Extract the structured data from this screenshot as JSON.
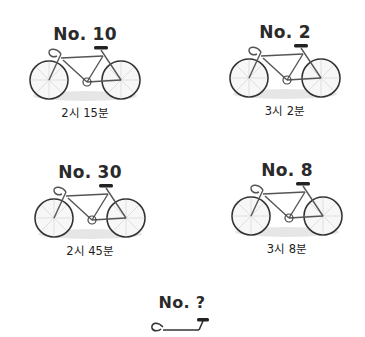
{
  "puzzle": {
    "items": [
      {
        "label": "No. 10",
        "time": "2시 15분"
      },
      {
        "label": "No. 2",
        "time": "3시 2분"
      },
      {
        "label": "No. 30",
        "time": "2시 45분"
      },
      {
        "label": "No. 8",
        "time": "3시 8분"
      }
    ],
    "question": {
      "label": "No. ?"
    }
  },
  "icons": {
    "bike": "bicycle-icon",
    "partial_bike": "handlebar-icon"
  }
}
